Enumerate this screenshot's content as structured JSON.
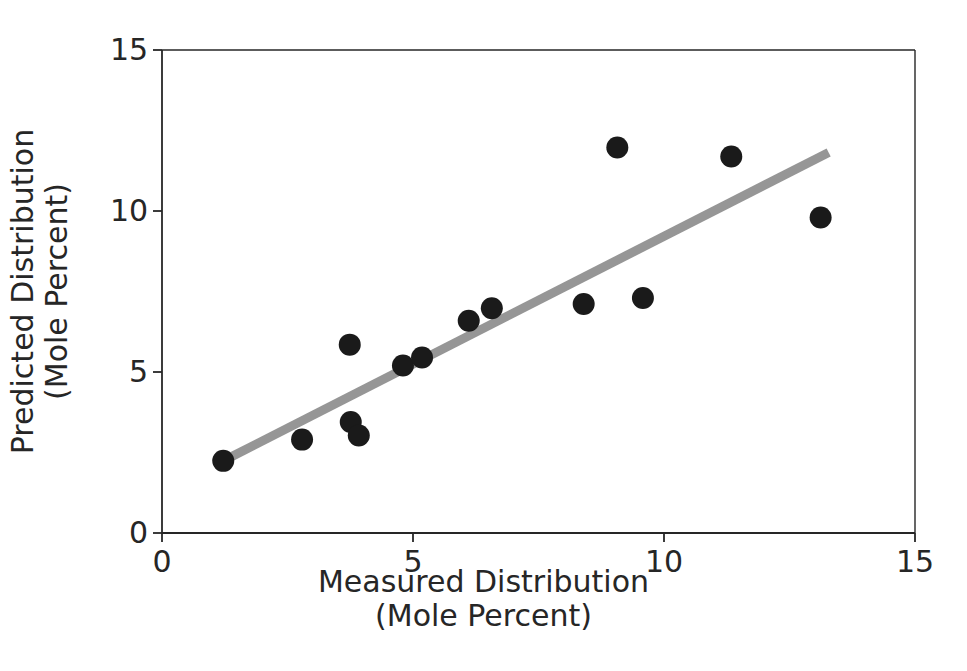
{
  "chart_data": {
    "type": "scatter",
    "title": "",
    "xlabel": "Measured Distribution (Mole Percent)",
    "ylabel": "Predicted Distribution (Mole Percent)",
    "xlim": [
      0,
      15
    ],
    "ylim": [
      0,
      15
    ],
    "xticks": [
      0,
      5,
      10,
      15
    ],
    "yticks": [
      0,
      5,
      10,
      15
    ],
    "xtick_labels": [
      "0",
      "5",
      "10",
      "15"
    ],
    "ytick_labels": [
      "0",
      "5",
      "10",
      "15"
    ],
    "grid": false,
    "legend": null,
    "marker": {
      "shape": "circle",
      "color": "#1a1a1a",
      "size_px": 11
    },
    "series": [
      {
        "name": "Predicted vs Measured",
        "points": [
          {
            "x": 1.22,
            "y": 2.24
          },
          {
            "x": 2.79,
            "y": 2.9
          },
          {
            "x": 3.74,
            "y": 5.85
          },
          {
            "x": 3.76,
            "y": 3.45
          },
          {
            "x": 3.92,
            "y": 3.03
          },
          {
            "x": 4.8,
            "y": 5.2
          },
          {
            "x": 5.18,
            "y": 5.45
          },
          {
            "x": 6.11,
            "y": 6.59
          },
          {
            "x": 6.57,
            "y": 6.98
          },
          {
            "x": 8.4,
            "y": 7.11
          },
          {
            "x": 9.07,
            "y": 11.97
          },
          {
            "x": 9.58,
            "y": 7.3
          },
          {
            "x": 11.34,
            "y": 11.69
          },
          {
            "x": 13.12,
            "y": 9.8
          }
        ]
      }
    ],
    "trend_line": {
      "name": "fit-line",
      "color": "#969696",
      "width_px": 9,
      "start": {
        "x": 1.22,
        "y": 2.24
      },
      "end": {
        "x": 13.28,
        "y": 11.82
      }
    },
    "axes_style": {
      "spine_color": "#262626",
      "spine_width_px": 1.6,
      "tick_direction": "out",
      "background": "#ffffff"
    }
  },
  "labels": {
    "x_axis_line1": "Measured Distribution",
    "x_axis_line2": "(Mole Percent)",
    "y_axis_line1": "Predicted Distribution",
    "y_axis_line2": "(Mole Percent)",
    "x_tick_0": "0",
    "x_tick_1": "5",
    "x_tick_2": "10",
    "x_tick_3": "15",
    "y_tick_0": "0",
    "y_tick_1": "5",
    "y_tick_2": "10",
    "y_tick_3": "15"
  }
}
